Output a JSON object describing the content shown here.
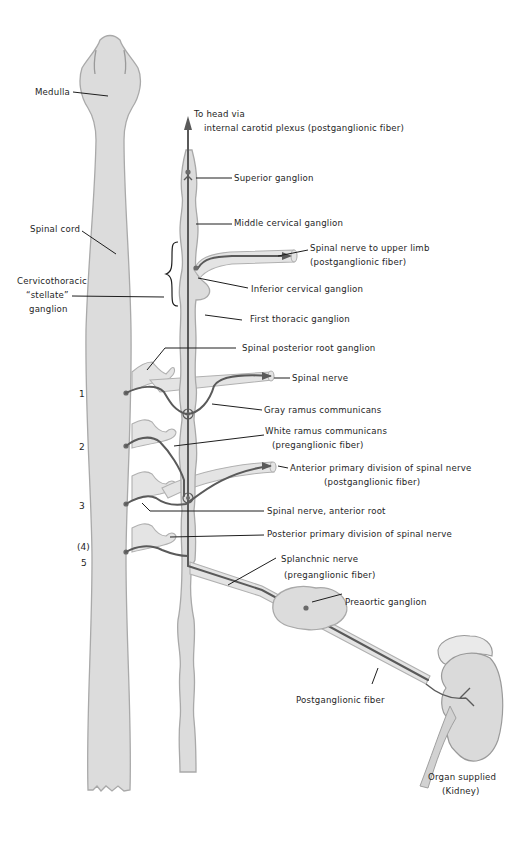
{
  "diagram": {
    "labels": {
      "medulla": "Medulla",
      "to_head_1": "To head via",
      "to_head_2": "internal carotid  plexus (postganglionic fiber)",
      "superior_ganglion": "Superior ganglion",
      "middle_cervical_ganglion": "Middle cervical ganglion",
      "spinal_cord": "Spinal cord",
      "spinal_nerve_upper_limb_1": "Spinal nerve to upper limb",
      "spinal_nerve_upper_limb_2": "(postganglionic fiber)",
      "stellate_1": "Cervicothoracic",
      "stellate_2": "“stellate”",
      "stellate_3": "ganglion",
      "inferior_cervical_ganglion": "Inferior cervical ganglion",
      "first_thoracic_ganglion": "First thoracic ganglion",
      "spinal_posterior_root_ganglion": "Spinal posterior root ganglion",
      "spinal_nerve": "Spinal nerve",
      "gray_ramus": "Gray ramus communicans",
      "white_ramus_1": "White ramus communicans",
      "white_ramus_2": "(preganglionic fiber)",
      "anterior_primary_1": "Anterior primary division of spinal nerve",
      "anterior_primary_2": "(postganglionic fiber)",
      "anterior_root": "Spinal nerve, anterior root",
      "posterior_primary": "Posterior primary division of spinal nerve",
      "splanchnic_1": "Splanchnic nerve",
      "splanchnic_2": "(preganglionic fiber)",
      "preaortic_ganglion": "Preaortic ganglion",
      "postganglionic_fiber": "Postganglionic fiber",
      "organ_1": "Organ supplied",
      "organ_2": "(Kidney)"
    },
    "segment_numbers": [
      "1",
      "2",
      "3",
      "(4)",
      "5"
    ]
  }
}
